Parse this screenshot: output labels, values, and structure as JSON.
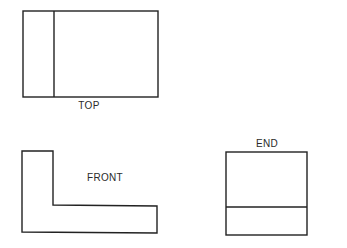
{
  "views": {
    "top": {
      "label": "TOP"
    },
    "front": {
      "label": "FRONT"
    },
    "end": {
      "label": "END"
    }
  },
  "colors": {
    "line": "#222222",
    "background": "#ffffff"
  }
}
